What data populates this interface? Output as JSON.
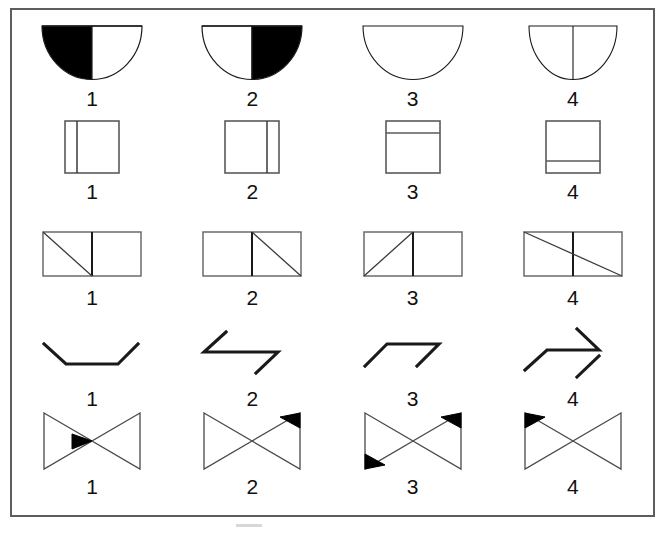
{
  "figure": {
    "background_color": "#ffffff",
    "frame_color": "#5d5d5d",
    "stroke_color": "#1a1a1a",
    "fill_color": "#000000",
    "rows": [
      {
        "name": "half-disc-row",
        "shape": "half-disc",
        "items": [
          {
            "label": "1",
            "variant": "left-half-filled"
          },
          {
            "label": "2",
            "variant": "right-half-filled"
          },
          {
            "label": "3",
            "variant": "empty-no-divider"
          },
          {
            "label": "4",
            "variant": "empty-with-divider"
          }
        ]
      },
      {
        "name": "square-divider-row",
        "shape": "square",
        "items": [
          {
            "label": "1",
            "variant": "vertical-line-left"
          },
          {
            "label": "2",
            "variant": "vertical-line-right"
          },
          {
            "label": "3",
            "variant": "horizontal-line-top"
          },
          {
            "label": "4",
            "variant": "horizontal-line-bottom"
          }
        ]
      },
      {
        "name": "double-rectangle-diagonal-row",
        "shape": "double-rectangle",
        "items": [
          {
            "label": "1",
            "variant": "diagonal-left-cell-down"
          },
          {
            "label": "2",
            "variant": "diagonal-right-cell-down"
          },
          {
            "label": "3",
            "variant": "diagonal-left-cell-up"
          },
          {
            "label": "4",
            "variant": "diagonal-full-width-down"
          }
        ]
      },
      {
        "name": "zigzag-row",
        "shape": "zigzag",
        "items": [
          {
            "label": "1",
            "variant": "down-flat-up"
          },
          {
            "label": "2",
            "variant": "up-flat-down-offset"
          },
          {
            "label": "3",
            "variant": "up-flat-down"
          },
          {
            "label": "4",
            "variant": "up-flat-up-offset"
          }
        ]
      },
      {
        "name": "bowtie-row",
        "shape": "bowtie",
        "items": [
          {
            "label": "1",
            "variant": "center-left-arrow-filled"
          },
          {
            "label": "2",
            "variant": "top-right-filled"
          },
          {
            "label": "3",
            "variant": "top-right-and-bottom-left-filled"
          },
          {
            "label": "4",
            "variant": "top-left-filled"
          }
        ]
      }
    ]
  }
}
